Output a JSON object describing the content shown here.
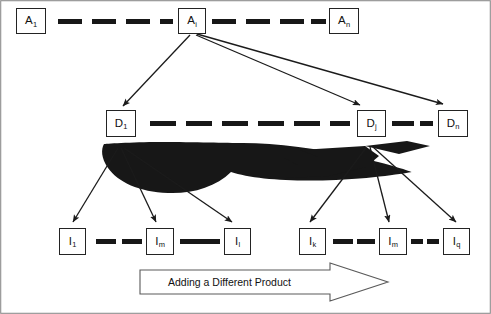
{
  "diagram": {
    "title_text": "Adding a Different Product",
    "colors": {
      "background": "#ffffff",
      "stroke": "#232323",
      "fill_black": "#171717",
      "banner_fill": "#ffffff",
      "banner_stroke": "#5a5a5a",
      "text": "#111111"
    },
    "rows": {
      "assembly": {
        "name": "assembly-row",
        "nodes": [
          {
            "id": "a1",
            "base": "A",
            "sub": "1",
            "x": 16,
            "y": 8,
            "w": 30,
            "h": 26
          },
          {
            "id": "ai",
            "base": "A",
            "sub": "i",
            "x": 178,
            "y": 8,
            "w": 28,
            "h": 26
          },
          {
            "id": "an",
            "base": "A",
            "sub": "n",
            "x": 329,
            "y": 8,
            "w": 30,
            "h": 26
          }
        ],
        "dash_segments": [
          {
            "x": 58,
            "y": 19,
            "w": 24,
            "h": 5
          },
          {
            "x": 92,
            "y": 19,
            "w": 24,
            "h": 5
          },
          {
            "x": 126,
            "y": 19,
            "w": 24,
            "h": 5
          },
          {
            "x": 160,
            "y": 19,
            "w": 13,
            "h": 5
          },
          {
            "x": 212,
            "y": 19,
            "w": 24,
            "h": 5
          },
          {
            "x": 246,
            "y": 19,
            "w": 24,
            "h": 5
          },
          {
            "x": 280,
            "y": 19,
            "w": 24,
            "h": 5
          },
          {
            "x": 311,
            "y": 19,
            "w": 15,
            "h": 5
          }
        ]
      },
      "department": {
        "name": "department-row",
        "nodes": [
          {
            "id": "d1",
            "base": "D",
            "sub": "1",
            "x": 106,
            "y": 110,
            "w": 30,
            "h": 27
          },
          {
            "id": "dj",
            "base": "D",
            "sub": "j",
            "x": 357,
            "y": 110,
            "w": 29,
            "h": 27
          },
          {
            "id": "dn",
            "base": "D",
            "sub": "n",
            "x": 438,
            "y": 110,
            "w": 30,
            "h": 27
          }
        ],
        "dash_segments": [
          {
            "x": 150,
            "y": 121,
            "w": 26,
            "h": 5
          },
          {
            "x": 186,
            "y": 121,
            "w": 26,
            "h": 5
          },
          {
            "x": 222,
            "y": 121,
            "w": 26,
            "h": 5
          },
          {
            "x": 258,
            "y": 121,
            "w": 26,
            "h": 5
          },
          {
            "x": 294,
            "y": 121,
            "w": 26,
            "h": 5
          },
          {
            "x": 330,
            "y": 121,
            "w": 20,
            "h": 5
          },
          {
            "x": 392,
            "y": 121,
            "w": 22,
            "h": 5
          },
          {
            "x": 420,
            "y": 121,
            "w": 13,
            "h": 5
          }
        ]
      },
      "item": {
        "name": "item-row",
        "nodes": [
          {
            "id": "i1a",
            "base": "I",
            "sub": "1",
            "x": 59,
            "y": 228,
            "w": 27,
            "h": 27
          },
          {
            "id": "im1",
            "base": "I",
            "sub": "m",
            "x": 146,
            "y": 228,
            "w": 28,
            "h": 27
          },
          {
            "id": "il",
            "base": "I",
            "sub": "l",
            "x": 224,
            "y": 228,
            "w": 27,
            "h": 27
          },
          {
            "id": "ik",
            "base": "I",
            "sub": "k",
            "x": 299,
            "y": 228,
            "w": 27,
            "h": 27
          },
          {
            "id": "im2",
            "base": "I",
            "sub": "m",
            "x": 379,
            "y": 228,
            "w": 28,
            "h": 27
          },
          {
            "id": "iq",
            "base": "I",
            "sub": "q",
            "x": 443,
            "y": 228,
            "w": 27,
            "h": 27
          }
        ],
        "dash_segments": [
          {
            "x": 96,
            "y": 239,
            "w": 20,
            "h": 5
          },
          {
            "x": 122,
            "y": 239,
            "w": 20,
            "h": 5
          },
          {
            "x": 180,
            "y": 239,
            "w": 20,
            "h": 5
          },
          {
            "x": 200,
            "y": 239,
            "w": 20,
            "h": 5
          },
          {
            "x": 333,
            "y": 239,
            "w": 20,
            "h": 5
          },
          {
            "x": 357,
            "y": 239,
            "w": 18,
            "h": 5
          },
          {
            "x": 411,
            "y": 239,
            "w": 12,
            "h": 5
          },
          {
            "x": 427,
            "y": 239,
            "w": 12,
            "h": 5
          }
        ]
      }
    },
    "arrows": {
      "from_assembly": [
        {
          "name": "arrow-ai-to-d1",
          "x1": 190,
          "y1": 35,
          "x2": 123,
          "y2": 106
        },
        {
          "name": "arrow-ai-to-dj",
          "x1": 196,
          "y1": 35,
          "x2": 360,
          "y2": 105
        },
        {
          "name": "arrow-ai-to-dn",
          "x1": 197,
          "y1": 34,
          "x2": 443,
          "y2": 104
        }
      ],
      "from_department_left": [
        {
          "name": "arrow-d1-to-i1",
          "x1": 118,
          "y1": 148,
          "x2": 73,
          "y2": 222
        },
        {
          "name": "arrow-d1-to-im",
          "x1": 121,
          "y1": 148,
          "x2": 156,
          "y2": 222
        },
        {
          "name": "arrow-d1-to-il",
          "x1": 124,
          "y1": 148,
          "x2": 232,
          "y2": 222
        }
      ],
      "from_department_right": [
        {
          "name": "arrow-dj-to-ik",
          "x1": 366,
          "y1": 148,
          "x2": 310,
          "y2": 222
        },
        {
          "name": "arrow-dj-to-im",
          "x1": 370,
          "y1": 147,
          "x2": 389,
          "y2": 222
        },
        {
          "name": "arrow-dj-to-iq",
          "x1": 373,
          "y1": 147,
          "x2": 456,
          "y2": 222
        }
      ]
    },
    "blobs": [
      {
        "name": "black-swoosh-left"
      },
      {
        "name": "black-swoosh-right"
      }
    ],
    "banner": {
      "name": "adding-different-product-banner",
      "x": 140,
      "y": 270,
      "body_w": 190,
      "h": 24,
      "head_w": 58,
      "text_x": 168,
      "text_y": 287
    },
    "frame": {
      "name": "diagram-frame",
      "x": 0.7,
      "y": 0.7,
      "w": 489.6,
      "h": 312.6
    }
  }
}
